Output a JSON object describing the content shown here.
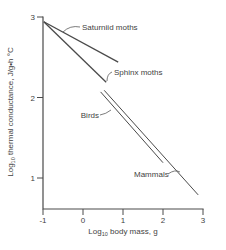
{
  "colors": {
    "background": "#ffffff",
    "line": "#4a4a4a",
    "text": "#3f3f3f"
  },
  "chart_data": {
    "type": "line",
    "title": "",
    "xlabel": {
      "prefix": "Log",
      "sub": "10",
      "rest": " body mass, g"
    },
    "ylabel": {
      "prefix": "Log",
      "sub": "10",
      "rest": " thermal conductance, J/g•h °C"
    },
    "x_ticks": [
      -1,
      0,
      1,
      2,
      3
    ],
    "y_ticks": [
      1,
      2,
      3
    ],
    "xlim": [
      -1,
      3
    ],
    "ylim": [
      0.6,
      3
    ],
    "grid": false,
    "legend_position": "inline-annotations",
    "series": [
      {
        "name": "Saturniid moths",
        "x": [
          -0.98,
          0.88
        ],
        "y": [
          2.94,
          2.44
        ]
      },
      {
        "name": "Sphinx moths",
        "x": [
          -0.98,
          0.58
        ],
        "y": [
          2.94,
          2.19
        ]
      },
      {
        "name": "Birds",
        "x": [
          0.44,
          2.0
        ],
        "y": [
          2.07,
          1.19
        ]
      },
      {
        "name": "Mammals",
        "x": [
          0.53,
          2.88
        ],
        "y": [
          2.09,
          0.79
        ]
      }
    ]
  }
}
